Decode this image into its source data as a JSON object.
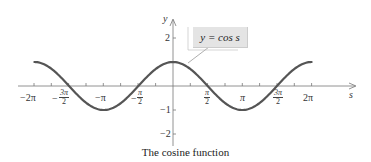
{
  "figure": {
    "caption": "The cosine function",
    "legend_label": "y = cos s",
    "x_axis_label": "s",
    "y_axis_label": "y"
  },
  "chart_data": {
    "type": "line",
    "title": "The cosine function",
    "xlabel": "s",
    "ylabel": "y",
    "series": [
      {
        "name": "y = cos s",
        "function": "cos(s)",
        "domain": [
          "-2π",
          "2π"
        ]
      }
    ],
    "x_ticks": [
      "-2π",
      "-3π/2",
      "-π",
      "-π/2",
      "π/2",
      "π",
      "3π/2",
      "2π"
    ],
    "y_ticks": [
      "2",
      "-1",
      "-2"
    ],
    "xlim": [
      "-2π",
      "2π"
    ],
    "ylim": [
      -2.5,
      2.5
    ],
    "grid": false,
    "legend_position": "callout near peak",
    "curve_color": "#555555"
  },
  "labels": {
    "x": {
      "neg2pi": "−2π",
      "neg3pi2_num": "3π",
      "neg3pi2_den": "2",
      "negpi": "−π",
      "negpi2_num": "π",
      "negpi2_den": "2",
      "pi2_num": "π",
      "pi2_den": "2",
      "pi": "π",
      "threepi2_num": "3π",
      "threepi2_den": "2",
      "twopi": "2π"
    },
    "y": {
      "two": "2",
      "negone": "−1",
      "negtwo": "−2"
    }
  }
}
